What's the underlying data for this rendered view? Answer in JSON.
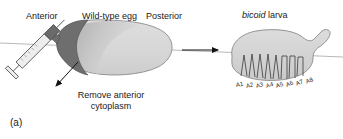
{
  "figure": {
    "panel_label": "(a)",
    "background_color": "#ffffff",
    "line_color": "#808080",
    "outline_color": "#555555"
  },
  "left_panel": {
    "labels": {
      "anterior": "Anterior",
      "title": "Wild-type egg",
      "posterior": "Posterior"
    },
    "egg": {
      "body_fill": "#d9d9d9",
      "anterior_cap_fill": "#6e6e6e",
      "anterior_gradient_fill": "#b0b0b0"
    },
    "instrument": {
      "name": "syringe",
      "barrel_fill": "#e8e8e8",
      "contents_fill": "#6e6e6e"
    },
    "caption": {
      "line1": "Remove anterior",
      "line2": "cytoplasm"
    }
  },
  "transition": {
    "arrow": "right-arrow"
  },
  "right_panel": {
    "labels": {
      "gene": "bicoid",
      "type": "larva"
    },
    "larva": {
      "body_fill": "#d4d4d4",
      "denticle_color": "#3a3a3a"
    },
    "segments": [
      {
        "label": "A1"
      },
      {
        "label": "A2"
      },
      {
        "label": "A3"
      },
      {
        "label": "A4"
      },
      {
        "label": "A5"
      },
      {
        "label": "A6"
      },
      {
        "label": "A7"
      },
      {
        "label": "A8"
      }
    ]
  }
}
